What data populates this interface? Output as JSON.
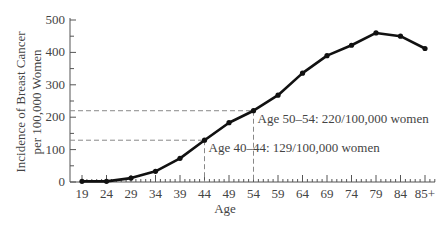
{
  "chart_data": {
    "type": "line",
    "title": "",
    "xlabel": "Age",
    "ylabel_line1": "Incidence of Breast Cancer",
    "ylabel_line2": "per 100,000 Women",
    "ylabel": "Incidence of Breast Cancer per 100,000 Women",
    "categories": [
      "19",
      "24",
      "29",
      "34",
      "39",
      "44",
      "49",
      "54",
      "59",
      "64",
      "69",
      "74",
      "79",
      "84",
      "85+"
    ],
    "values": [
      2,
      2,
      12,
      33,
      73,
      129,
      183,
      220,
      268,
      336,
      390,
      422,
      460,
      450,
      412
    ],
    "ylim": [
      0,
      500
    ],
    "yticks": [
      "0",
      "100",
      "200",
      "300",
      "400",
      "500"
    ],
    "grid": false,
    "legend": "none",
    "annotations": [
      {
        "category": "44",
        "value": 129,
        "text": "Age 40–44: 129/100,000 women"
      },
      {
        "category": "54",
        "value": 220,
        "text": "Age 50–54: 220/100,000 women"
      }
    ],
    "colors": {
      "line": "#111111",
      "axis": "#555555",
      "guide": "#888888"
    }
  }
}
